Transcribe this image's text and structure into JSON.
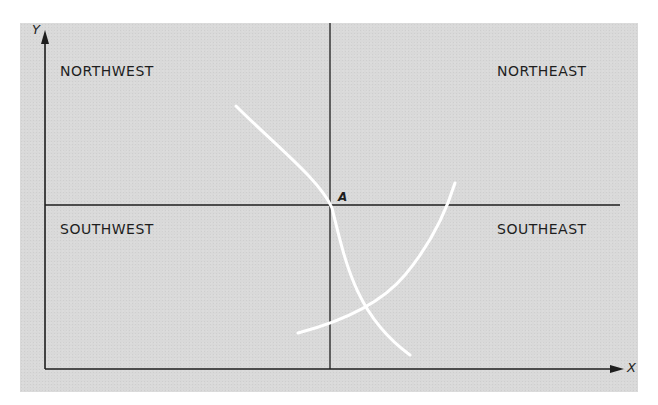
{
  "diagram": {
    "axes": {
      "y_label": "Y",
      "x_label": "X"
    },
    "quadrants": {
      "northwest": "NORTHWEST",
      "northeast": "NORTHEAST",
      "southwest": "SOUTHWEST",
      "southeast": "SOUTHEAST"
    },
    "point": {
      "label": "A"
    },
    "colors": {
      "background": "#d9d9d9",
      "lines": "#1e1e1e",
      "curves": "#ffffff"
    }
  }
}
